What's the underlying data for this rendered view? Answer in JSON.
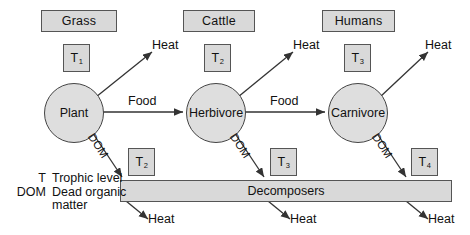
{
  "diagram": {
    "examples": [
      {
        "label": "Grass",
        "x": 41,
        "y": 10,
        "w": 74,
        "h": 20
      },
      {
        "label": "Cattle",
        "x": 183,
        "y": 10,
        "w": 70,
        "h": 20
      },
      {
        "label": "Humans",
        "x": 322,
        "y": 10,
        "w": 71,
        "h": 20
      }
    ],
    "trophic_top": [
      {
        "label": "T",
        "sub": "1",
        "x": 63,
        "y": 44,
        "w": 25,
        "h": 26
      },
      {
        "label": "T",
        "sub": "2",
        "x": 204,
        "y": 44,
        "w": 25,
        "h": 26
      },
      {
        "label": "T",
        "sub": "3",
        "x": 344,
        "y": 44,
        "w": 25,
        "h": 26
      }
    ],
    "organisms": [
      {
        "label": "Plant",
        "cx": 73,
        "cy": 112,
        "r": 29
      },
      {
        "label": "Herbivore",
        "cx": 215,
        "cy": 112,
        "r": 29
      },
      {
        "label": "Carnivore",
        "cx": 357,
        "cy": 112,
        "r": 29
      }
    ],
    "flow_labels": [
      {
        "label": "Food",
        "x": 128,
        "y": 94
      },
      {
        "label": "Food",
        "x": 270,
        "y": 94
      }
    ],
    "heat_labels_top": [
      {
        "label": "Heat",
        "x": 152,
        "y": 38
      },
      {
        "label": "Heat",
        "x": 293,
        "y": 38
      },
      {
        "label": "Heat",
        "x": 425,
        "y": 38
      }
    ],
    "dom_labels": [
      {
        "label": "DOM",
        "x": 96,
        "y": 131
      },
      {
        "label": "DOM",
        "x": 238,
        "y": 131
      },
      {
        "label": "DOM",
        "x": 380,
        "y": 131
      }
    ],
    "trophic_bottom": [
      {
        "label": "T",
        "sub": "2",
        "x": 128,
        "y": 148,
        "w": 25,
        "h": 26
      },
      {
        "label": "T",
        "sub": "3",
        "x": 270,
        "y": 148,
        "w": 25,
        "h": 26
      },
      {
        "label": "T",
        "sub": "4",
        "x": 411,
        "y": 148,
        "w": 25,
        "h": 26
      }
    ],
    "decomposers": {
      "label": "Decomposers",
      "x": 120,
      "y": 180,
      "w": 330,
      "h": 20
    },
    "heat_labels_bottom": [
      {
        "label": "Heat",
        "x": 148,
        "y": 206
      },
      {
        "label": "Heat",
        "x": 290,
        "y": 206
      },
      {
        "label": "Heat",
        "x": 428,
        "y": 206
      }
    ],
    "legend": [
      {
        "key": "T",
        "value": "Trophic level"
      },
      {
        "key": "DOM",
        "value": "Dead organic"
      },
      {
        "key": "",
        "value": "matter"
      }
    ],
    "colors": {
      "box_fill": "#d9d9d9",
      "circle_fill": "#dedede",
      "stroke": "#555555",
      "line": "#333333",
      "text": "#111111",
      "background": "#ffffff"
    }
  }
}
